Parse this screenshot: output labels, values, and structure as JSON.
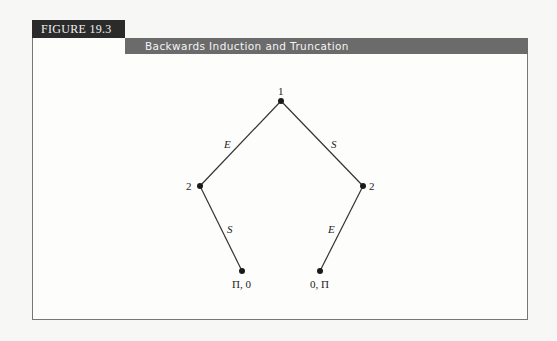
{
  "figure": {
    "label": "FIGURE 19.3",
    "title": "Backwards Induction and Truncation"
  },
  "tree": {
    "nodes": [
      {
        "id": "root",
        "player": "1",
        "x": 281,
        "y": 101
      },
      {
        "id": "left",
        "player": "2",
        "x": 200,
        "y": 186
      },
      {
        "id": "right",
        "player": "2",
        "x": 363,
        "y": 186
      },
      {
        "id": "left-terminal",
        "payoff": "Π, 0",
        "x": 242,
        "y": 271
      },
      {
        "id": "right-terminal",
        "payoff": "0, Π",
        "x": 320,
        "y": 271
      }
    ],
    "edges": [
      {
        "from": "root",
        "to": "left",
        "action": "E"
      },
      {
        "from": "root",
        "to": "right",
        "action": "S"
      },
      {
        "from": "left",
        "to": "left-terminal",
        "action": "S"
      },
      {
        "from": "right",
        "to": "right-terminal",
        "action": "E"
      }
    ]
  },
  "colors": {
    "label_bg": "#2b2b2b",
    "title_bg": "#6b6b6b",
    "line": "#333333"
  }
}
